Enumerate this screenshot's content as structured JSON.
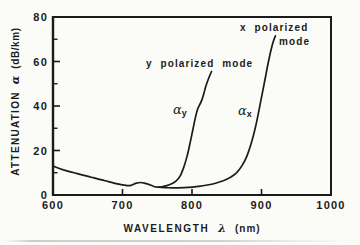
{
  "colors": {
    "background": "#fbfbf8",
    "ink": "#1b1b1b"
  },
  "chart_data": {
    "type": "line",
    "title": "",
    "xlabel": "WAVELENGTH λ (nm)",
    "ylabel": "ATTENUATION α (dB/km)",
    "xlim": [
      600,
      1000
    ],
    "ylim": [
      0,
      80
    ],
    "grid": false,
    "x_ticks_labeled": [
      600,
      700,
      800,
      900,
      1000
    ],
    "x_ticks_marked": [
      700,
      800,
      900
    ],
    "y_ticks_labeled": [
      0,
      20,
      40,
      60,
      80
    ],
    "y_ticks_minor": [
      10,
      30,
      50,
      70
    ],
    "axes_parts": {
      "x_word": "WAVELENGTH",
      "x_symbol": "λ",
      "x_unit": "(nm)",
      "y_word": "ATTENUATION",
      "y_symbol": "α",
      "y_unit": "(dB/km)"
    },
    "series": [
      {
        "name": "y polarized mode (αy)",
        "x": [
          600,
          615,
          635,
          655,
          675,
          693,
          705,
          712,
          719,
          726,
          733,
          741,
          748,
          755,
          762,
          770,
          777,
          783,
          788,
          793,
          797,
          801,
          805,
          808,
          811,
          814,
          817,
          820,
          824,
          828
        ],
        "y": [
          13,
          11.3,
          9.6,
          8.0,
          6.4,
          5.0,
          4.3,
          4.3,
          5.2,
          5.6,
          5.2,
          4.4,
          3.6,
          3.6,
          4.1,
          4.9,
          6.2,
          8.6,
          12.4,
          17.5,
          23,
          29,
          35,
          38.5,
          40.5,
          42.5,
          45.5,
          49,
          52.5,
          55.5
        ]
      },
      {
        "name": "x polarized mode (αx)",
        "x": [
          752,
          765,
          780,
          795,
          810,
          822,
          834,
          845,
          855,
          864,
          872,
          879,
          885,
          891,
          896,
          901,
          906,
          910,
          914,
          917,
          920
        ],
        "y": [
          3.5,
          3.3,
          3.2,
          3.4,
          3.9,
          4.5,
          5.3,
          6.4,
          7.9,
          10,
          13.2,
          17.5,
          23,
          30,
          37.5,
          45.5,
          53.5,
          60,
          65.5,
          69,
          71.5
        ]
      }
    ],
    "annotations": {
      "y_mode_label": "y polarized mode",
      "x_mode_label_line1": "x polarized",
      "x_mode_label_line2": "mode",
      "alpha_symbol": "α",
      "alpha_y_sub": "y",
      "alpha_x_sub": "x"
    }
  }
}
